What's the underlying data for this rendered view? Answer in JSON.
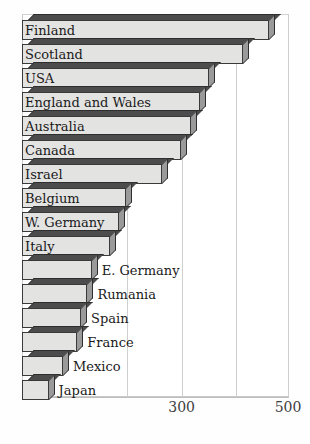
{
  "chart_data": {
    "type": "bar",
    "orientation": "horizontal",
    "title": "",
    "subtitle": "",
    "xlabel": "",
    "ylabel": "",
    "xlim": [
      0,
      500
    ],
    "grid": true,
    "legend": null,
    "gridlines": [
      200,
      300,
      400,
      500
    ],
    "tick_labels": [
      {
        "value": 300,
        "label": "300"
      },
      {
        "value": 500,
        "label": "500"
      }
    ],
    "categories": [
      "Finland",
      "Scotland",
      "USA",
      "England and Wales",
      "Australia",
      "Canada",
      "Israel",
      "Belgium",
      "W. Germany",
      "Italy",
      "E. Germany",
      "Rumania",
      "Spain",
      "France",
      "Mexico",
      "Japan"
    ],
    "values": [
      465,
      415,
      352,
      334,
      318,
      299,
      263,
      196,
      183,
      165,
      131,
      123,
      111,
      104,
      77,
      50
    ],
    "label_placement": [
      "inside",
      "inside",
      "inside",
      "inside",
      "inside",
      "inside",
      "inside",
      "inside",
      "inside",
      "inside",
      "outside",
      "outside",
      "outside",
      "outside",
      "outside",
      "outside"
    ],
    "style": {
      "bar_face_color": "#e3e3e2",
      "bar_top_color": "#4c4c4c",
      "bar_side_color": "#9a9a9a",
      "bar_edge_color": "#3a3a3a",
      "grid_color": "#cfcfcf",
      "frame_color": "#c9c9c9",
      "text_color": "#1a1a1a",
      "tick_color": "#3d3d3d",
      "background": "#ffffff"
    }
  }
}
